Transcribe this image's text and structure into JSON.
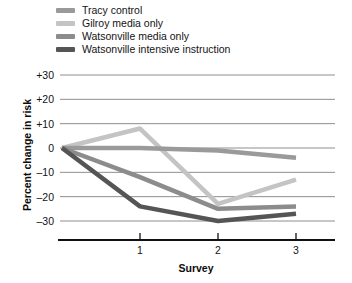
{
  "chart_data": {
    "type": "line",
    "title": "",
    "xlabel": "Survey",
    "ylabel": "Percent change in risk",
    "x": [
      0,
      1,
      2,
      3
    ],
    "xtick_labels": [
      "1",
      "2",
      "3"
    ],
    "xtick_values": [
      1,
      2,
      3
    ],
    "ytick_labels": [
      "+30",
      "+20",
      "+10",
      "0",
      "–10",
      "–20",
      "–30"
    ],
    "ytick_values": [
      30,
      20,
      10,
      0,
      -10,
      -20,
      -30
    ],
    "ylim": [
      -30,
      30
    ],
    "xlim": [
      0,
      3
    ],
    "grid": "horizontal",
    "legend_position": "top-left",
    "series": [
      {
        "name": "Tracy control",
        "color": "#9a9a9a",
        "values": [
          0,
          0,
          -1,
          -4
        ]
      },
      {
        "name": "Gilroy media only",
        "color": "#c4c4c4",
        "values": [
          0,
          8,
          -23,
          -13
        ]
      },
      {
        "name": "Watsonville media only",
        "color": "#8c8c8c",
        "values": [
          0,
          -12,
          -25,
          -24
        ]
      },
      {
        "name": "Watsonville intensive instruction",
        "color": "#555555",
        "values": [
          0,
          -24,
          -30,
          -27
        ]
      }
    ]
  },
  "legend": {
    "items": [
      {
        "label": "Tracy control",
        "color": "#9a9a9a"
      },
      {
        "label": "Gilroy media only",
        "color": "#c4c4c4"
      },
      {
        "label": "Watsonville media only",
        "color": "#8c8c8c"
      },
      {
        "label": "Watsonville intensive instruction",
        "color": "#555555"
      }
    ]
  },
  "axes": {
    "y_title": "Percent change in risk",
    "x_title": "Survey",
    "y_labels": [
      "+30",
      "+20",
      "+10",
      "0",
      "–10",
      "–20",
      "–30"
    ],
    "x_labels": [
      "1",
      "2",
      "3"
    ]
  },
  "colors": {
    "gridline": "#8e8e8e",
    "axis": "#111111",
    "text": "#131313"
  }
}
